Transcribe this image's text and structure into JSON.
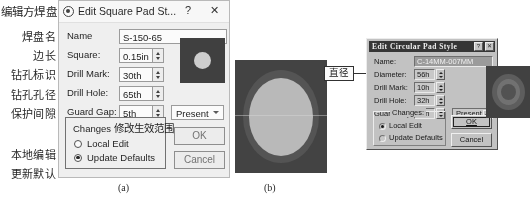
{
  "annotations": {
    "title_cn": "编辑方焊盘",
    "labels_cn": [
      "焊盘名",
      "边长",
      "钻孔标识",
      "钻孔孔径",
      "保护间隙",
      "本地编辑",
      "更新默认"
    ],
    "callout_cn": "直径"
  },
  "captions": {
    "a": "(a)",
    "b": "(b)"
  },
  "dialog_a": {
    "title": "Edit Square Pad St...",
    "icon": "app-icon",
    "help_label": "?",
    "close_label": "✕",
    "fields": [
      {
        "label": "Name",
        "value": "S-150-65",
        "spinner": false
      },
      {
        "label": "Square:",
        "value": "0.15in",
        "spinner": true
      },
      {
        "label": "Drill Mark:",
        "value": "30th",
        "spinner": true
      },
      {
        "label": "Drill Hole:",
        "value": "65th",
        "spinner": true
      },
      {
        "label": "Guard Gap:",
        "value": "5th",
        "spinner": true
      }
    ],
    "dropdown": {
      "value": "Present"
    },
    "changes_group": {
      "title_en": "Changes",
      "title_cn": "修改生效范围",
      "options": [
        {
          "label": "Local Edit",
          "selected": false
        },
        {
          "label": "Update Defaults",
          "selected": true
        }
      ]
    },
    "buttons": {
      "ok": "OK",
      "cancel": "Cancel"
    },
    "preview": {
      "name": "square-pad-preview"
    }
  },
  "dialog_b": {
    "title": "Edit Circular Pad Style",
    "help_label": "?",
    "close_label": "✕",
    "fields": [
      {
        "label": "Name:",
        "value": "C-14MM-007MM",
        "spinner": false,
        "selected": true
      },
      {
        "label": "Diameter:",
        "value": "56h",
        "spinner": true
      },
      {
        "label": "Drill Mark:",
        "value": "10h",
        "spinner": true
      },
      {
        "label": "Drill Hole:",
        "value": "32h",
        "spinner": true
      },
      {
        "label": "Guard Gap:",
        "value": "10h",
        "spinner": true
      }
    ],
    "dropdown": {
      "value": "Present"
    },
    "changes_group": {
      "title_en": "Changes:",
      "options": [
        {
          "label": "Local Edit",
          "selected": true
        },
        {
          "label": "Update Defaults",
          "selected": false
        }
      ]
    },
    "buttons": {
      "ok": "OK",
      "cancel": "Cancel"
    },
    "preview": {
      "name": "circular-pad-preview"
    }
  },
  "preview_b": {
    "name": "circular-pad-large-preview"
  }
}
